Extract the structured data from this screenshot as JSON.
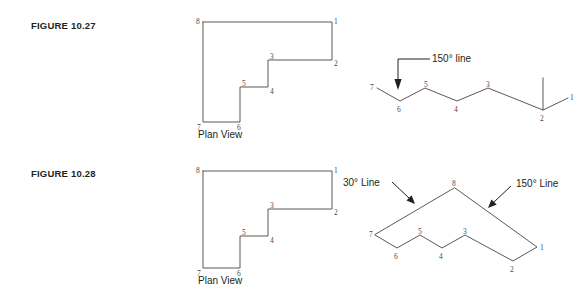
{
  "page": {
    "width": 587,
    "height": 291,
    "background": "#ffffff",
    "line_color": "#59595b",
    "text_color": "#231f20"
  },
  "figures": [
    {
      "id": "figure-10-27",
      "label": "FIGURE 10.27",
      "views": [
        {
          "id": "plan-view-1027",
          "caption": "Plan View",
          "type": "plan",
          "vertex_labels": [
            "1",
            "2",
            "3",
            "4",
            "5",
            "6",
            "7",
            "8"
          ]
        },
        {
          "id": "auxiliary-view-1027",
          "type": "zigzag",
          "vertex_labels": [
            "1",
            "2",
            "3",
            "4",
            "5",
            "6",
            "7"
          ],
          "annotations": [
            {
              "id": "anno-150-line-1027",
              "text": "150° line",
              "points_to": "6"
            }
          ]
        }
      ]
    },
    {
      "id": "figure-10-28",
      "label": "FIGURE 10.28",
      "views": [
        {
          "id": "plan-view-1028",
          "caption": "Plan View",
          "type": "plan",
          "vertex_labels": [
            "1",
            "2",
            "3",
            "4",
            "5",
            "6",
            "7",
            "8"
          ]
        },
        {
          "id": "auxiliary-view-1028",
          "type": "chevron",
          "vertex_labels": [
            "1",
            "2",
            "3",
            "4",
            "5",
            "6",
            "7",
            "8"
          ],
          "annotations": [
            {
              "id": "anno-30-line-1028",
              "text": "30° Line",
              "points_to": "7-8 edge"
            },
            {
              "id": "anno-150-line-1028",
              "text": "150° Line",
              "points_to": "8-1 edge"
            }
          ]
        }
      ]
    }
  ],
  "vertices": {
    "plan_1027": {
      "v8": "8",
      "v1": "1",
      "v2": "2",
      "v3": "3",
      "v4": "4",
      "v5": "5",
      "v6": "6",
      "v7": "7"
    },
    "zigzag_1027": {
      "v7": "7",
      "v6": "6",
      "v5": "5",
      "v4": "4",
      "v3": "3",
      "v2": "2",
      "v1": "1"
    },
    "plan_1028": {
      "v8": "8",
      "v1": "1",
      "v2": "2",
      "v3": "3",
      "v4": "4",
      "v5": "5",
      "v6": "6",
      "v7": "7"
    },
    "chevron_1028": {
      "v8": "8",
      "v7": "7",
      "v6": "6",
      "v5": "5",
      "v4": "4",
      "v3": "3",
      "v2": "2",
      "v1": "1"
    }
  },
  "captions": {
    "plan_view": "Plan View"
  }
}
